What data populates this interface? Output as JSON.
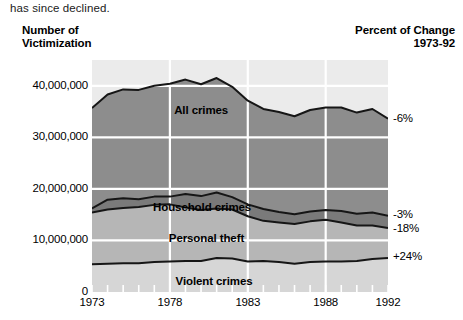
{
  "caption": "has since declined.",
  "header": {
    "left_line1": "Number of",
    "left_line2": "Victimization",
    "right_line1": "Percent of Change",
    "right_line2": "1973-92"
  },
  "chart_data": {
    "type": "area",
    "title": "Number of Victimization",
    "xlabel": "",
    "ylabel": "Number of Victimization",
    "xlim": [
      1973,
      1992
    ],
    "ylim": [
      0,
      45000000
    ],
    "grid": true,
    "legend": "in-plot labels",
    "x_ticks": [
      "1973",
      "1978",
      "1983",
      "1988",
      "1992"
    ],
    "x_tick_values": [
      1973,
      1978,
      1983,
      1988,
      1992
    ],
    "y_ticks": [
      "0",
      "10,000,000",
      "20,000,000",
      "30,000,000",
      "40,000,000"
    ],
    "y_tick_values": [
      0,
      10000000,
      20000000,
      30000000,
      40000000
    ],
    "x": [
      1973,
      1974,
      1975,
      1976,
      1977,
      1978,
      1979,
      1980,
      1981,
      1982,
      1983,
      1984,
      1985,
      1986,
      1987,
      1988,
      1989,
      1990,
      1991,
      1992
    ],
    "series": [
      {
        "name": "All crimes",
        "label": "All crimes",
        "color": "#8d8d8d",
        "pct_change": "-6%",
        "values": [
          35700000,
          38300000,
          39300000,
          39200000,
          40000000,
          40400000,
          41200000,
          40300000,
          41500000,
          39800000,
          37100000,
          35500000,
          34900000,
          34100000,
          35300000,
          35800000,
          35800000,
          34800000,
          35500000,
          33600000
        ]
      },
      {
        "name": "Household crimes",
        "label": "Household crimes",
        "color": "#7a7a7a",
        "pct_change": "",
        "values": [
          16200000,
          17900000,
          18200000,
          18000000,
          18500000,
          18500000,
          19000000,
          18600000,
          19300000,
          18400000,
          17000000,
          16100000,
          15500000,
          15100000,
          15600000,
          15900000,
          15700000,
          15200000,
          15400000,
          14800000
        ]
      },
      {
        "name": "Personal theft",
        "label": "Personal theft",
        "color": "#b6b6b6",
        "pct_change": "-3%",
        "values": [
          15400000,
          16000000,
          16300000,
          16500000,
          16900000,
          17000000,
          16400000,
          15900000,
          16200000,
          16000000,
          14700000,
          13800000,
          13500000,
          13200000,
          13700000,
          14000000,
          13500000,
          12900000,
          12900000,
          12400000
        ]
      },
      {
        "name": "Violent crimes",
        "label": "Violent crimes",
        "color": "#d6d6d6",
        "pct_change": "+24%",
        "values": [
          5400000,
          5500000,
          5600000,
          5600000,
          5800000,
          5900000,
          6000000,
          6000000,
          6600000,
          6500000,
          5900000,
          6000000,
          5800000,
          5500000,
          5800000,
          5900000,
          5900000,
          6000000,
          6400000,
          6600000
        ]
      }
    ],
    "pct_labels": [
      {
        "text": "-6%",
        "series": "All crimes"
      },
      {
        "text": "-3%",
        "series": "Personal theft"
      },
      {
        "text": "-18%",
        "series": "Household crimes"
      },
      {
        "text": "+24%",
        "series": "Violent crimes"
      }
    ]
  }
}
